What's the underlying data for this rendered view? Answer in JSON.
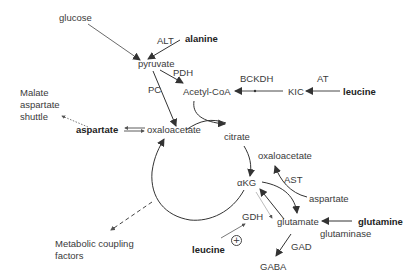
{
  "diagram": {
    "nodes": {
      "glucose": "glucose",
      "alanine": "alanine",
      "alt": "ALT",
      "pyruvate": "pyruvate",
      "pdh": "PDH",
      "pc": "PC",
      "acetyl_coa": "Acetyl-CoA",
      "bckdh": "BCKDH",
      "kic": "KIC",
      "at": "AT",
      "leucine_top": "leucine",
      "malate_shuttle_line1": "Malate",
      "malate_shuttle_line2": "aspartate",
      "malate_shuttle_line3": "shuttle",
      "aspartate_left": "aspartate",
      "oxaloacetate_cycle": "oxaloacetate",
      "citrate": "citrate",
      "oxaloacetate_right": "oxaloacetate",
      "ast": "AST",
      "alpha_kg": "αKG",
      "aspartate_right": "aspartate",
      "gdh": "GDH",
      "glutamate": "glutamate",
      "glutamine": "glutamine",
      "glutaminase": "glutaminase",
      "gad": "GAD",
      "gaba": "GABA",
      "leucine_bottom": "leucine",
      "plus_sign": "+",
      "metabolic_line1": "Metabolic coupling",
      "metabolic_line2": "factors"
    },
    "colors": {
      "line": "#333333",
      "dashed": "#555555",
      "faint": "#999999"
    }
  }
}
